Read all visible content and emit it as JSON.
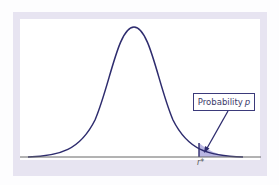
{
  "diagram": {
    "type": "normal-distribution-right-tail",
    "label": {
      "text": "Probability",
      "variable": "p"
    },
    "critical_value": "r*",
    "colors": {
      "curve": "#2e2c6e",
      "shade": "#b9b6e2",
      "frame": "#e7e4f1",
      "axis": "#555555"
    }
  }
}
